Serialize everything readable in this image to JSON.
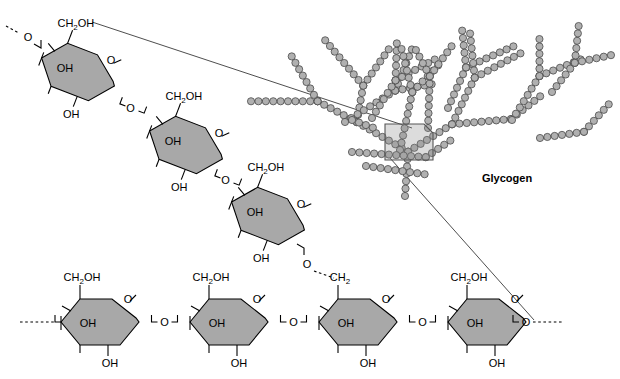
{
  "figure": {
    "caption": "Glycogen",
    "background_color": "#ffffff",
    "ring_fill_color": "#a8a8a8",
    "bead_fill_color": "#b0b0b0",
    "bead_stroke_color": "#4a4a4a",
    "highlight_fill_color": "rgba(140,140,140,0.30)"
  },
  "labels": {
    "ch2oh": "CH",
    "ch2oh_sub": "2",
    "ch2oh_tail": "OH",
    "ch2": "CH",
    "ch2_sub": "2",
    "oh": "OH",
    "o": "O"
  },
  "branch_chain": {
    "name": "alpha-1,6 branch chain",
    "description": "Diagonal chain of four glucose residues descending left-to-right",
    "residues": [
      {
        "index": 1,
        "c6_label": "CH2OH",
        "c2_label": "OH",
        "c3_label": "OH",
        "ring_o_label": "O",
        "glycosidic_o_label": "O"
      },
      {
        "index": 2,
        "c6_label": "CH2OH",
        "c2_label": "OH",
        "c3_label": "OH",
        "ring_o_label": "O",
        "glycosidic_o_label": "O"
      },
      {
        "index": 3,
        "c6_label": "CH2OH",
        "c2_label": "OH",
        "c3_label": "OH",
        "ring_o_label": "O",
        "glycosidic_o_label": "O"
      }
    ],
    "terminal_left_bond": "dashed"
  },
  "main_chain": {
    "name": "alpha-1,4 main chain",
    "description": "Horizontal chain of four glucose residues",
    "residues": [
      {
        "index": 1,
        "c6_label": "CH2OH",
        "c2_label": "OH",
        "c3_label": "OH",
        "ring_o_label": "O",
        "is_branch_point": false
      },
      {
        "index": 2,
        "c6_label": "CH2OH",
        "c2_label": "OH",
        "c3_label": "OH",
        "ring_o_label": "O",
        "is_branch_point": false
      },
      {
        "index": 3,
        "c6_label": "CH2",
        "c2_label": "OH",
        "c3_label": "OH",
        "ring_o_label": "O",
        "is_branch_point": true
      },
      {
        "index": 4,
        "c6_label": "CH2OH",
        "c2_label": "OH",
        "c3_label": "OH",
        "ring_o_label": "O",
        "is_branch_point": false
      }
    ],
    "terminal_left_bond": "dashed",
    "terminal_right_bond": "dashed"
  },
  "glycogen_tree": {
    "label": "Glycogen",
    "description": "Highly branched polymer of glucose drawn as chains of beads",
    "bead_count": 238,
    "highlight_region": {
      "name": "magnified-region",
      "x": 385,
      "y": 124,
      "width": 48,
      "height": 36,
      "bevel_corner": "top-right"
    }
  }
}
